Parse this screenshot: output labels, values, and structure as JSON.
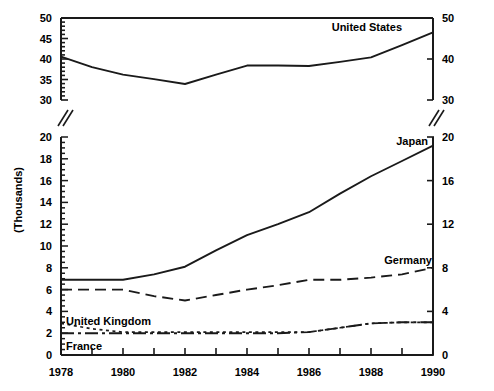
{
  "chart_data": {
    "type": "line",
    "title": "",
    "subtitle": "",
    "xlabel": "",
    "ylabel": "(Thousands)",
    "x": [
      1978,
      1979,
      1980,
      1981,
      1982,
      1983,
      1984,
      1985,
      1986,
      1987,
      1988,
      1989,
      1990
    ],
    "xlim": [
      1978,
      1990
    ],
    "x_tick_interval": 1,
    "x_tick_labels": [
      "1978",
      "1980",
      "1982",
      "1984",
      "1986",
      "1988",
      "1990"
    ],
    "x_tick_label_values": [
      1978,
      1980,
      1982,
      1984,
      1986,
      1988,
      1990
    ],
    "grid": false,
    "legend_position": "inline-labels",
    "broken_axis": true,
    "axis_break_symbol": "double-slash",
    "panels": [
      {
        "name": "upper-panel",
        "ylim": [
          30,
          50
        ],
        "left_axis_tick_labels": [
          "30",
          "35",
          "40",
          "45",
          "50"
        ],
        "left_axis_tick_values": [
          30,
          35,
          40,
          45,
          50
        ],
        "left_axis_minor_tick_interval": 1,
        "right_axis_tick_labels": [
          "30",
          "40",
          "50"
        ],
        "right_axis_tick_values": [
          30,
          40,
          50
        ],
        "series": [
          {
            "name": "United States",
            "label": "United States",
            "line_style": "solid",
            "color": "#1a1a1a",
            "values": [
              40.6,
              38.0,
              36.2,
              35.1,
              33.9,
              36.2,
              38.4,
              38.4,
              38.3,
              39.3,
              40.4,
              43.4,
              46.5
            ]
          }
        ]
      },
      {
        "name": "lower-panel",
        "ylim": [
          0,
          20
        ],
        "left_axis_tick_labels": [
          "0",
          "2",
          "4",
          "6",
          "8",
          "10",
          "12",
          "14",
          "16",
          "18",
          "20"
        ],
        "left_axis_tick_values": [
          0,
          2,
          4,
          6,
          8,
          10,
          12,
          14,
          16,
          18,
          20
        ],
        "left_axis_minor_tick_interval": 0.5,
        "right_axis_tick_labels": [
          "0",
          "4",
          "8",
          "12",
          "16",
          "20"
        ],
        "right_axis_tick_values": [
          0,
          4,
          8,
          12,
          16,
          20
        ],
        "series": [
          {
            "name": "Japan",
            "label": "Japan",
            "line_style": "solid",
            "color": "#1a1a1a",
            "values": [
              6.9,
              6.9,
              6.9,
              7.4,
              8.1,
              9.6,
              11.0,
              12.0,
              13.1,
              14.8,
              16.4,
              17.8,
              19.2
            ]
          },
          {
            "name": "Germany",
            "label": "Germany",
            "line_style": "dashed",
            "color": "#1a1a1a",
            "values": [
              6.0,
              6.0,
              6.0,
              5.4,
              5.0,
              5.5,
              6.0,
              6.4,
              6.9,
              6.9,
              7.1,
              7.4,
              8.0
            ]
          },
          {
            "name": "United Kingdom",
            "label": "United Kingdom",
            "line_style": "dotted",
            "color": "#1a1a1a",
            "values": [
              2.9,
              2.4,
              2.1,
              2.1,
              2.1,
              2.1,
              2.1,
              2.1,
              2.1,
              2.5,
              2.9,
              3.0,
              3.0
            ]
          },
          {
            "name": "France",
            "label": "France",
            "line_style": "dash-dot",
            "color": "#1a1a1a",
            "values": [
              2.0,
              2.0,
              2.0,
              2.0,
              2.0,
              2.0,
              2.0,
              2.0,
              2.1,
              2.5,
              2.9,
              3.0,
              3.0
            ]
          }
        ]
      }
    ]
  }
}
